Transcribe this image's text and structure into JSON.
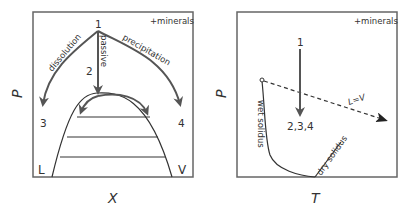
{
  "colors": {
    "frame": "#666666",
    "arrow": "#555555",
    "curve": "#333333",
    "text": "#333333"
  },
  "left_panel": {
    "y_axis_label": "P",
    "x_axis_label": "X",
    "corner_note": "+minerals",
    "point_labels": {
      "start": "1",
      "passive_end": "2",
      "dissolution_end": "3",
      "precipitation_end": "4"
    },
    "arrow_labels": {
      "dissolution": "dissolution",
      "passive": "passive",
      "precipitation": "precipitation"
    },
    "phase_labels": {
      "liquid": "L",
      "vapor": "V"
    }
  },
  "right_panel": {
    "y_axis_label": "P",
    "x_axis_label": "T",
    "corner_note": "+minerals",
    "point_labels": {
      "start": "1",
      "end": "2,3,4"
    },
    "curve_labels": {
      "wet_solidus": "wet solidus",
      "dry_solidus": "dry solidus",
      "critical_curve": "L=V"
    }
  }
}
